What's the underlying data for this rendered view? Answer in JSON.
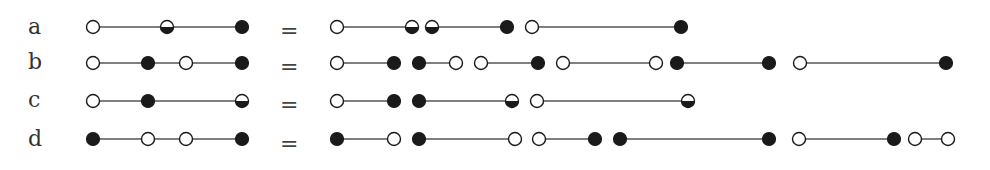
{
  "diagram": {
    "type": "chain-decomposition",
    "node_legend": {
      "open": "hollow circle",
      "filled": "solid black circle",
      "half": "half-filled circle (bottom black)"
    },
    "colors": {
      "ink": "#1a1a1a",
      "line": "#555555",
      "background": "#ffffff"
    },
    "equals_sign": "=",
    "rows": [
      {
        "label": "a",
        "y": 27,
        "left": {
          "nodes": [
            {
              "x": 93,
              "t": "open"
            },
            {
              "x": 167,
              "t": "half"
            },
            {
              "x": 242,
              "t": "filled"
            }
          ],
          "segments": [
            [
              93,
              242
            ]
          ]
        },
        "right": {
          "groups": [
            {
              "nodes": [
                {
                  "x": 337,
                  "t": "open"
                },
                {
                  "x": 412,
                  "t": "half"
                }
              ],
              "segments": [
                [
                  337,
                  412
                ]
              ]
            },
            {
              "nodes": [
                {
                  "x": 432,
                  "t": "half"
                },
                {
                  "x": 507,
                  "t": "filled"
                }
              ],
              "segments": [
                [
                  432,
                  507
                ]
              ]
            },
            {
              "nodes": [
                {
                  "x": 532,
                  "t": "open"
                },
                {
                  "x": 681,
                  "t": "filled"
                }
              ],
              "segments": [
                [
                  532,
                  681
                ]
              ]
            }
          ]
        }
      },
      {
        "label": "b",
        "y": 63,
        "left": {
          "nodes": [
            {
              "x": 93,
              "t": "open"
            },
            {
              "x": 148,
              "t": "filled"
            },
            {
              "x": 186,
              "t": "open"
            },
            {
              "x": 242,
              "t": "filled"
            }
          ],
          "segments": [
            [
              93,
              242
            ]
          ]
        },
        "right": {
          "groups": [
            {
              "nodes": [
                {
                  "x": 337,
                  "t": "open"
                },
                {
                  "x": 394,
                  "t": "filled"
                }
              ],
              "segments": [
                [
                  337,
                  394
                ]
              ]
            },
            {
              "nodes": [
                {
                  "x": 419,
                  "t": "filled"
                },
                {
                  "x": 456,
                  "t": "open"
                }
              ],
              "segments": [
                [
                  419,
                  456
                ]
              ]
            },
            {
              "nodes": [
                {
                  "x": 481,
                  "t": "open"
                },
                {
                  "x": 538,
                  "t": "filled"
                }
              ],
              "segments": [
                [
                  481,
                  538
                ]
              ]
            },
            {
              "nodes": [
                {
                  "x": 563,
                  "t": "open"
                },
                {
                  "x": 656,
                  "t": "open"
                }
              ],
              "segments": [
                [
                  563,
                  656
                ]
              ]
            },
            {
              "nodes": [
                {
                  "x": 677,
                  "t": "filled"
                },
                {
                  "x": 769,
                  "t": "filled"
                }
              ],
              "segments": [
                [
                  677,
                  769
                ]
              ]
            },
            {
              "nodes": [
                {
                  "x": 800,
                  "t": "open"
                },
                {
                  "x": 946,
                  "t": "filled"
                }
              ],
              "segments": [
                [
                  800,
                  946
                ]
              ]
            }
          ]
        }
      },
      {
        "label": "c",
        "y": 101,
        "left": {
          "nodes": [
            {
              "x": 93,
              "t": "open"
            },
            {
              "x": 148,
              "t": "filled"
            },
            {
              "x": 242,
              "t": "half"
            }
          ],
          "segments": [
            [
              93,
              242
            ]
          ]
        },
        "right": {
          "groups": [
            {
              "nodes": [
                {
                  "x": 337,
                  "t": "open"
                },
                {
                  "x": 394,
                  "t": "filled"
                }
              ],
              "segments": [
                [
                  337,
                  394
                ]
              ]
            },
            {
              "nodes": [
                {
                  "x": 419,
                  "t": "filled"
                },
                {
                  "x": 512,
                  "t": "half"
                }
              ],
              "segments": [
                [
                  419,
                  512
                ]
              ]
            },
            {
              "nodes": [
                {
                  "x": 537,
                  "t": "open"
                },
                {
                  "x": 688,
                  "t": "half"
                }
              ],
              "segments": [
                [
                  537,
                  688
                ]
              ]
            }
          ]
        }
      },
      {
        "label": "d",
        "y": 139,
        "left": {
          "nodes": [
            {
              "x": 93,
              "t": "filled"
            },
            {
              "x": 148,
              "t": "open"
            },
            {
              "x": 186,
              "t": "open"
            },
            {
              "x": 242,
              "t": "filled"
            }
          ],
          "segments": [
            [
              93,
              242
            ]
          ]
        },
        "right": {
          "groups": [
            {
              "nodes": [
                {
                  "x": 337,
                  "t": "filled"
                },
                {
                  "x": 394,
                  "t": "open"
                }
              ],
              "segments": [
                [
                  337,
                  394
                ]
              ]
            },
            {
              "nodes": [
                {
                  "x": 419,
                  "t": "filled"
                },
                {
                  "x": 515,
                  "t": "open"
                }
              ],
              "segments": [
                [
                  419,
                  515
                ]
              ]
            },
            {
              "nodes": [
                {
                  "x": 539,
                  "t": "open"
                },
                {
                  "x": 595,
                  "t": "filled"
                }
              ],
              "segments": [
                [
                  539,
                  595
                ]
              ]
            },
            {
              "nodes": [
                {
                  "x": 620,
                  "t": "filled"
                },
                {
                  "x": 769,
                  "t": "filled"
                }
              ],
              "segments": [
                [
                  620,
                  769
                ]
              ]
            },
            {
              "nodes": [
                {
                  "x": 799,
                  "t": "open"
                },
                {
                  "x": 894,
                  "t": "filled"
                }
              ],
              "segments": [
                [
                  799,
                  894
                ]
              ]
            },
            {
              "nodes": [
                {
                  "x": 915,
                  "t": "open"
                },
                {
                  "x": 948,
                  "t": "open"
                }
              ],
              "segments": [
                [
                  915,
                  948
                ]
              ]
            }
          ]
        }
      }
    ]
  }
}
